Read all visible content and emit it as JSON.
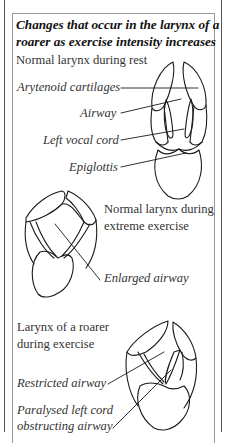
{
  "title": {
    "line1": "Changes that occur in the larynx of a",
    "line2": "roarer as exercise intensity increases"
  },
  "panels": [
    {
      "heading": "Normal larynx during rest",
      "callouts": [
        "Arytenoid cartilages",
        "Airway",
        "Left vocal cord",
        "Epiglottis"
      ]
    },
    {
      "heading_line1": "Normal larynx during",
      "heading_line2": "extreme exercise",
      "callouts": [
        "Enlarged airway"
      ]
    },
    {
      "heading_line1": "Larynx of a roarer",
      "heading_line2": "during exercise",
      "callouts": [
        "Restricted airway",
        "Paralysed left cord",
        "obstructing airway"
      ]
    }
  ],
  "colors": {
    "line": "#1a1a1a",
    "border": "#9a9a9a",
    "text": "#333333"
  }
}
